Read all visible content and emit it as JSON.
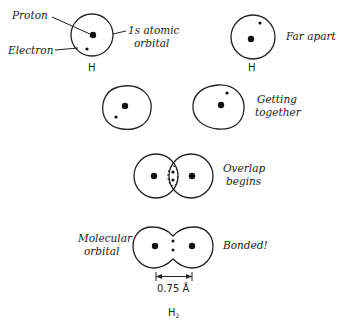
{
  "figure": {
    "stages": [
      {
        "id": "isolated",
        "labels": {
          "proton": "Proton",
          "electron": "Electron",
          "orbital_line1": "1s atomic",
          "orbital_line2": "orbital"
        },
        "atom_symbol": "H"
      },
      {
        "id": "far-apart",
        "label": "Far apart",
        "atom_symbol": "H"
      },
      {
        "id": "getting-together",
        "label_line1": "Getting",
        "label_line2": "together"
      },
      {
        "id": "overlap-begins",
        "label_line1": "Overlap",
        "label_line2": "begins"
      },
      {
        "id": "bonded",
        "label": "Bonded!",
        "left_label_line1": "Molecular",
        "left_label_line2": "orbital"
      }
    ],
    "bond_length": "0.75 Å",
    "molecule": "H",
    "molecule_subscript": "2",
    "colors": {
      "ink": "#222222",
      "background": "#ffffff"
    }
  }
}
